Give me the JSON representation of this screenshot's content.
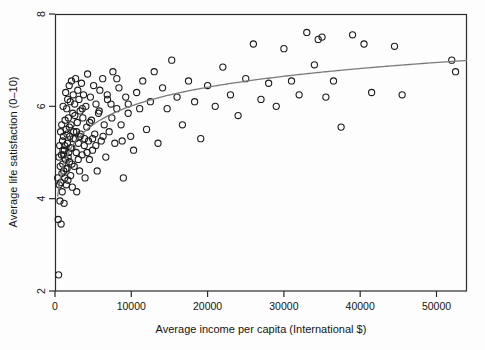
{
  "chart_data": {
    "type": "scatter",
    "title": "",
    "xlabel": "Average income per capita (International $)",
    "ylabel": "Average life satisfaction (0–10)",
    "xlim": [
      0,
      54000
    ],
    "ylim": [
      2,
      8
    ],
    "xticks": [
      0,
      10000,
      20000,
      30000,
      40000,
      50000
    ],
    "xticklabels": [
      "0",
      "10000",
      "20000",
      "30000",
      "40000",
      "50000"
    ],
    "yticks": [
      2,
      4,
      6,
      8
    ],
    "yticklabels": [
      "2",
      "4",
      "6",
      "8"
    ],
    "grid": false,
    "legend": null,
    "marker": {
      "shape": "open-circle",
      "radius": 3.1,
      "edge_color": "#1c1c1c",
      "fill_color": "none",
      "edge_width": 1.1
    },
    "series": [
      {
        "name": "Countries",
        "type": "scatter",
        "points": [
          [
            350,
            4.45
          ],
          [
            420,
            3.55
          ],
          [
            470,
            2.35
          ],
          [
            520,
            4.9
          ],
          [
            560,
            4.3
          ],
          [
            610,
            5.15
          ],
          [
            650,
            3.95
          ],
          [
            690,
            4.7
          ],
          [
            730,
            5.45
          ],
          [
            760,
            4.35
          ],
          [
            800,
            3.45
          ],
          [
            840,
            4.95
          ],
          [
            880,
            5.6
          ],
          [
            910,
            4.55
          ],
          [
            950,
            4.15
          ],
          [
            980,
            5.25
          ],
          [
            1010,
            4.75
          ],
          [
            1060,
            6.0
          ],
          [
            1100,
            5.35
          ],
          [
            1150,
            4.6
          ],
          [
            1190,
            3.9
          ],
          [
            1230,
            5.05
          ],
          [
            1280,
            4.45
          ],
          [
            1320,
            5.7
          ],
          [
            1360,
            4.85
          ],
          [
            1400,
            6.3
          ],
          [
            1450,
            5.5
          ],
          [
            1490,
            4.3
          ],
          [
            1530,
            5.95
          ],
          [
            1580,
            4.65
          ],
          [
            1620,
            5.2
          ],
          [
            1660,
            6.15
          ],
          [
            1700,
            4.4
          ],
          [
            1750,
            5.75
          ],
          [
            1800,
            5.0
          ],
          [
            1860,
            6.45
          ],
          [
            1900,
            4.8
          ],
          [
            1950,
            5.35
          ],
          [
            2000,
            6.1
          ],
          [
            2050,
            4.5
          ],
          [
            2100,
            5.6
          ],
          [
            2160,
            6.55
          ],
          [
            2210,
            5.1
          ],
          [
            2270,
            4.25
          ],
          [
            2330,
            5.85
          ],
          [
            2390,
            6.25
          ],
          [
            2450,
            5.45
          ],
          [
            2520,
            4.7
          ],
          [
            2580,
            6.05
          ],
          [
            2640,
            5.3
          ],
          [
            2700,
            6.6
          ],
          [
            2780,
            5.0
          ],
          [
            2850,
            4.15
          ],
          [
            2920,
            5.65
          ],
          [
            2990,
            6.35
          ],
          [
            3060,
            5.2
          ],
          [
            3140,
            6.15
          ],
          [
            3220,
            4.6
          ],
          [
            3300,
            5.9
          ],
          [
            3380,
            5.4
          ],
          [
            3470,
            6.5
          ],
          [
            3560,
            4.95
          ],
          [
            3650,
            5.75
          ],
          [
            3740,
            6.25
          ],
          [
            3840,
            5.15
          ],
          [
            3940,
            4.45
          ],
          [
            4050,
            6.0
          ],
          [
            4160,
            5.55
          ],
          [
            4270,
            6.7
          ],
          [
            4390,
            5.25
          ],
          [
            4510,
            4.85
          ],
          [
            4640,
            6.2
          ],
          [
            4780,
            5.7
          ],
          [
            4920,
            5.05
          ],
          [
            5060,
            6.45
          ],
          [
            5210,
            5.4
          ],
          [
            5370,
            6.05
          ],
          [
            5530,
            4.6
          ],
          [
            5700,
            5.85
          ],
          [
            5880,
            6.35
          ],
          [
            6060,
            5.25
          ],
          [
            6250,
            6.6
          ],
          [
            6450,
            5.6
          ],
          [
            6660,
            4.9
          ],
          [
            6880,
            6.15
          ],
          [
            7100,
            5.45
          ],
          [
            7340,
            6.05
          ],
          [
            7590,
            6.75
          ],
          [
            7840,
            5.2
          ],
          [
            8100,
            5.95
          ],
          [
            8380,
            6.4
          ],
          [
            8660,
            5.6
          ],
          [
            8960,
            4.45
          ],
          [
            9270,
            6.2
          ],
          [
            9590,
            5.85
          ],
          [
            9920,
            5.35
          ],
          [
            10300,
            5.05
          ],
          [
            10700,
            6.3
          ],
          [
            11100,
            5.95
          ],
          [
            11500,
            6.55
          ],
          [
            12000,
            5.5
          ],
          [
            12500,
            6.1
          ],
          [
            13000,
            6.75
          ],
          [
            13500,
            5.2
          ],
          [
            14100,
            6.4
          ],
          [
            14700,
            5.95
          ],
          [
            15300,
            7.0
          ],
          [
            16000,
            6.2
          ],
          [
            16700,
            5.6
          ],
          [
            17500,
            6.55
          ],
          [
            18300,
            6.1
          ],
          [
            19100,
            5.3
          ],
          [
            20000,
            6.45
          ],
          [
            21000,
            6.0
          ],
          [
            22000,
            6.85
          ],
          [
            23000,
            6.25
          ],
          [
            24000,
            5.8
          ],
          [
            25000,
            6.6
          ],
          [
            26000,
            7.35
          ],
          [
            27000,
            6.15
          ],
          [
            28000,
            6.5
          ],
          [
            29000,
            6.0
          ],
          [
            30000,
            7.25
          ],
          [
            31000,
            6.55
          ],
          [
            32000,
            6.25
          ],
          [
            33000,
            7.6
          ],
          [
            34000,
            6.9
          ],
          [
            34500,
            7.45
          ],
          [
            35000,
            7.5
          ],
          [
            35500,
            6.2
          ],
          [
            36500,
            6.55
          ],
          [
            37500,
            5.55
          ],
          [
            39000,
            7.55
          ],
          [
            40500,
            7.35
          ],
          [
            41500,
            6.3
          ],
          [
            44500,
            7.3
          ],
          [
            45500,
            6.25
          ],
          [
            52000,
            7.0
          ],
          [
            52500,
            6.75
          ],
          [
            1050,
            5.05
          ],
          [
            1130,
            4.95
          ],
          [
            1280,
            5.15
          ],
          [
            1420,
            4.65
          ],
          [
            1560,
            5.4
          ],
          [
            1720,
            4.9
          ],
          [
            1880,
            5.55
          ],
          [
            2040,
            5.1
          ],
          [
            2220,
            4.75
          ],
          [
            2400,
            5.3
          ],
          [
            2600,
            5.8
          ],
          [
            2820,
            5.45
          ],
          [
            3050,
            4.85
          ],
          [
            3300,
            5.35
          ],
          [
            3580,
            5.95
          ],
          [
            3880,
            5.3
          ],
          [
            4200,
            5.0
          ],
          [
            4550,
            5.65
          ],
          [
            4930,
            5.3
          ],
          [
            5350,
            5.15
          ],
          [
            5800,
            5.9
          ],
          [
            6300,
            5.35
          ],
          [
            6850,
            6.25
          ],
          [
            7450,
            5.75
          ],
          [
            8100,
            6.6
          ],
          [
            8800,
            5.25
          ],
          [
            9600,
            6.05
          ]
        ]
      },
      {
        "name": "Fitted curve (log)",
        "type": "line",
        "color": "#7a7a7a",
        "width": 1.3,
        "model": "y = a + b * ln(x)",
        "a": 0.62,
        "b": 0.585,
        "x_start": 350,
        "x_end": 54000,
        "endpoints": [
          [
            350,
            4.05
          ],
          [
            54000,
            6.99
          ]
        ]
      }
    ],
    "n_points": 162
  },
  "figure": {
    "background": "#fdfdfd",
    "plot_box": {
      "left": 55,
      "top": 14,
      "right": 467,
      "bottom": 291
    },
    "frame_color": "#2b2b2b",
    "tick_color": "#2b2b2b"
  }
}
